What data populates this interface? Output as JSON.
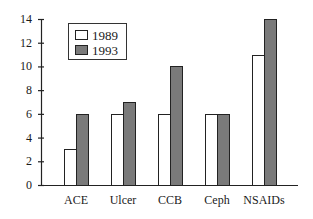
{
  "chart_data": {
    "type": "bar",
    "title": "",
    "xlabel": "",
    "ylabel": "",
    "ylim": [
      0,
      14
    ],
    "yticks": [
      0,
      2,
      4,
      6,
      8,
      10,
      12,
      14
    ],
    "categories": [
      "ACE",
      "Ulcer",
      "CCB",
      "Ceph",
      "NSAIDs"
    ],
    "series": [
      {
        "name": "1989",
        "color": "#ffffff",
        "values": [
          3,
          6,
          6,
          6,
          11
        ]
      },
      {
        "name": "1993",
        "color": "#7a7a7a",
        "values": [
          6,
          7,
          10,
          6,
          14
        ]
      }
    ],
    "grid": false,
    "legend_position": "upper-left"
  },
  "legend": {
    "items": [
      {
        "label": "1989",
        "color": "#ffffff"
      },
      {
        "label": "1993",
        "color": "#7a7a7a"
      }
    ]
  }
}
